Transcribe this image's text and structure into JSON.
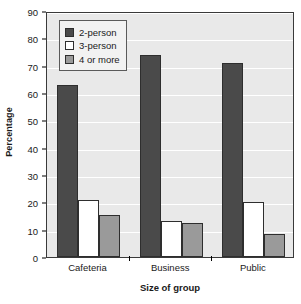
{
  "chart_data": {
    "type": "bar",
    "title": "",
    "xlabel": "Size of group",
    "ylabel": "Percentage",
    "categories": [
      "Cafeteria",
      "Business",
      "Public"
    ],
    "series": [
      {
        "name": "2-person",
        "color": "#4a4a4a",
        "values": [
          63,
          74,
          71
        ]
      },
      {
        "name": "3-person",
        "color": "#ffffff",
        "values": [
          21,
          13,
          20.3
        ]
      },
      {
        "name": "4 or more",
        "color": "#9a9a9a",
        "values": [
          15.5,
          12.5,
          8.5
        ]
      }
    ],
    "ylim": [
      0,
      90
    ],
    "ytick_step": 10,
    "yticks": [
      0,
      10,
      20,
      30,
      40,
      50,
      60,
      70,
      80,
      90
    ],
    "ytick_labels": [
      "0",
      "10",
      "20",
      "30",
      "40",
      "50",
      "60",
      "70",
      "80",
      "90"
    ],
    "grid": true,
    "grid_axis": "y",
    "legend_position": "top-left-inside",
    "plot_background": "#e9e9e9",
    "axis_color": "#3a3a3a",
    "slots_per_group": 4
  }
}
